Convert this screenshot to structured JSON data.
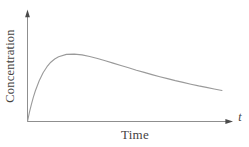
{
  "figure": {
    "background_color": "#ffffff",
    "axis_color": "#8f8f8f",
    "arrow_color": "#4a4a4a",
    "curve_color": "#9a9a9a",
    "text_color": "#45433f"
  },
  "chart_data": {
    "type": "line",
    "title": "",
    "xlabel": "Time",
    "ylabel": "Concentration",
    "x_end_label": "t",
    "grid": false,
    "tick_labels": "none",
    "legend": null,
    "x_range_normalized": [
      0,
      1
    ],
    "y_range_normalized": [
      0,
      1
    ],
    "series": [
      {
        "name": "concentration",
        "points": [
          [
            0,
            0
          ],
          [
            0.01,
            0.135
          ],
          [
            0.02,
            0.254
          ],
          [
            0.03,
            0.359
          ],
          [
            0.04,
            0.452
          ],
          [
            0.06,
            0.605
          ],
          [
            0.08,
            0.723
          ],
          [
            0.1,
            0.812
          ],
          [
            0.12,
            0.878
          ],
          [
            0.14,
            0.926
          ],
          [
            0.16,
            0.959
          ],
          [
            0.2,
            0.994
          ],
          [
            0.24,
            0.999
          ],
          [
            0.28,
            0.987
          ],
          [
            0.32,
            0.963
          ],
          [
            0.36,
            0.933
          ],
          [
            0.4,
            0.9
          ],
          [
            0.44,
            0.865
          ],
          [
            0.48,
            0.83
          ],
          [
            0.52,
            0.795
          ],
          [
            0.56,
            0.76
          ],
          [
            0.6,
            0.727
          ],
          [
            0.64,
            0.695
          ],
          [
            0.68,
            0.664
          ],
          [
            0.72,
            0.635
          ],
          [
            0.76,
            0.606
          ],
          [
            0.8,
            0.579
          ],
          [
            0.84,
            0.553
          ],
          [
            0.88,
            0.528
          ],
          [
            0.92,
            0.505
          ],
          [
            0.96,
            0.482
          ],
          [
            1,
            0.46
          ]
        ]
      }
    ]
  }
}
